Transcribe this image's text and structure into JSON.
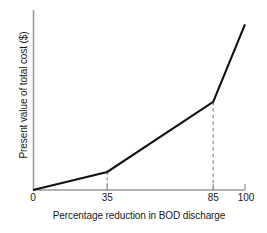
{
  "chart_data": {
    "type": "line",
    "title": "",
    "xlabel": "Percentage reduction in BOD discharge",
    "ylabel": "Present value of total cost ($)",
    "xlim": [
      0,
      100
    ],
    "ylim": [
      0,
      1
    ],
    "grid": false,
    "legend": "none",
    "x_tick_labels": [
      "0",
      "35",
      "85",
      "100"
    ],
    "x_tick_values": [
      0,
      35,
      85,
      100
    ],
    "y_tick_labels": [],
    "y_tick_values": [],
    "series": [
      {
        "name": "Present value of total cost",
        "color": "#111111",
        "x": [
          0,
          35,
          85,
          100
        ],
        "values": [
          0.0,
          0.1,
          0.49,
          0.92
        ]
      }
    ],
    "annotations": [
      {
        "name": "dropline-35",
        "x": 35,
        "y": 0.1,
        "style": "dashed"
      },
      {
        "name": "dropline-85",
        "x": 85,
        "y": 0.49,
        "style": "dashed"
      }
    ],
    "axis_color": "#999999",
    "line_color": "#111111",
    "dash_color": "#8a8a8a",
    "background": "#ffffff"
  },
  "figure": {
    "xlabel": "Percentage reduction in BOD discharge",
    "ylabel": "Present value of total cost ($)",
    "ticks": {
      "t0": "0",
      "t35": "35",
      "t85": "85",
      "t100": "100"
    }
  }
}
